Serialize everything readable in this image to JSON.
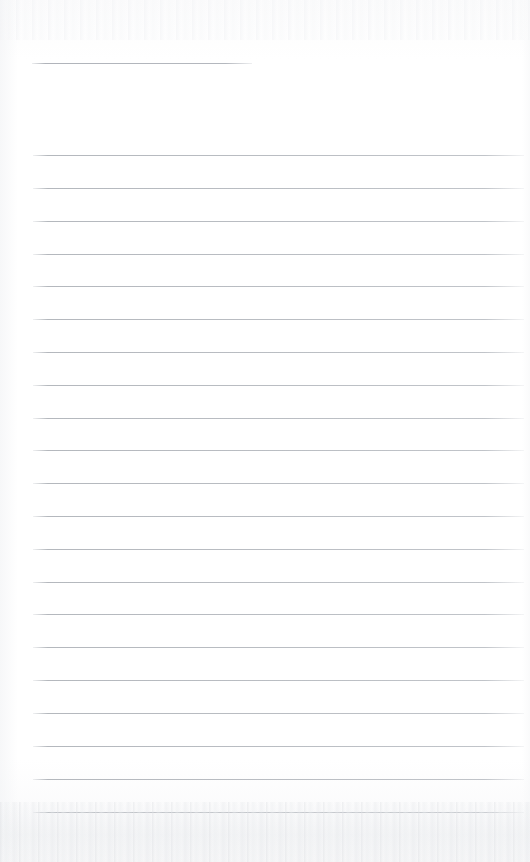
{
  "document": {
    "kind": "scanned-blank-ruled-page",
    "title": "Blank lined notebook page",
    "page_width": 530,
    "page_height": 862,
    "background_color": "#fdfdfd",
    "rule_color": "#b9bdc2",
    "text_content": "",
    "has_text": false,
    "annotations": []
  },
  "layout": {
    "left_margin_x": 33,
    "right_margin_x": 524,
    "first_rule_y": 155,
    "last_rule_y": 812,
    "rule_spacing": 32.85,
    "rule_thickness": 1
  },
  "header_rule": {
    "name": "header-short-rule",
    "x": 32,
    "y": 63,
    "width": 220
  },
  "rules": [
    {
      "index": 1,
      "y": 155,
      "x": 33,
      "width": 491
    },
    {
      "index": 2,
      "y": 188,
      "x": 33,
      "width": 491
    },
    {
      "index": 3,
      "y": 221,
      "x": 33,
      "width": 491
    },
    {
      "index": 4,
      "y": 254,
      "x": 33,
      "width": 491
    },
    {
      "index": 5,
      "y": 286,
      "x": 33,
      "width": 491
    },
    {
      "index": 6,
      "y": 319,
      "x": 33,
      "width": 491
    },
    {
      "index": 7,
      "y": 352,
      "x": 33,
      "width": 491
    },
    {
      "index": 8,
      "y": 385,
      "x": 33,
      "width": 491
    },
    {
      "index": 9,
      "y": 418,
      "x": 33,
      "width": 491
    },
    {
      "index": 10,
      "y": 450,
      "x": 33,
      "width": 491
    },
    {
      "index": 11,
      "y": 483,
      "x": 33,
      "width": 491
    },
    {
      "index": 12,
      "y": 516,
      "x": 33,
      "width": 491
    },
    {
      "index": 13,
      "y": 549,
      "x": 33,
      "width": 491
    },
    {
      "index": 14,
      "y": 582,
      "x": 33,
      "width": 491
    },
    {
      "index": 15,
      "y": 614,
      "x": 33,
      "width": 491
    },
    {
      "index": 16,
      "y": 647,
      "x": 33,
      "width": 491
    },
    {
      "index": 17,
      "y": 680,
      "x": 33,
      "width": 491
    },
    {
      "index": 18,
      "y": 713,
      "x": 33,
      "width": 491
    },
    {
      "index": 19,
      "y": 746,
      "x": 33,
      "width": 491
    },
    {
      "index": 20,
      "y": 779,
      "x": 33,
      "width": 491
    },
    {
      "index": 21,
      "y": 812,
      "x": 33,
      "width": 491
    }
  ]
}
